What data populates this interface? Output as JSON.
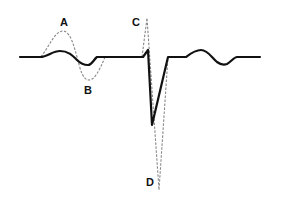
{
  "diagram": {
    "colors": {
      "solid_trace": "#111111",
      "dashed_trace": "#888888",
      "background": "#ffffff"
    },
    "labels": [
      {
        "id": "A",
        "text": "A",
        "x": 60,
        "y": 17
      },
      {
        "id": "B",
        "text": "B",
        "x": 84,
        "y": 85
      },
      {
        "id": "C",
        "text": "C",
        "x": 132,
        "y": 17
      },
      {
        "id": "D",
        "text": "D",
        "x": 146,
        "y": 177
      }
    ]
  }
}
